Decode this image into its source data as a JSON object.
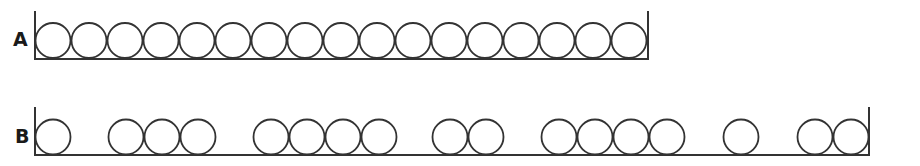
{
  "diagram": {
    "colors": {
      "stroke": "#333333",
      "background": "#ffffff"
    },
    "circle_diameter": 36,
    "rows": [
      {
        "label": "A",
        "circle_count": 17,
        "groups": [
          17
        ],
        "container": {
          "left_x": 35,
          "right_x": 648,
          "floor_y": 59,
          "wall_top_y": 11
        },
        "circle_cy": 40.5,
        "circle_starts_x": [
          35,
          71,
          107,
          143,
          179,
          215,
          251,
          287,
          323,
          359,
          395,
          431,
          467,
          503,
          539,
          575,
          611
        ]
      },
      {
        "label": "B",
        "circle_count": 17,
        "groups": [
          1,
          3,
          4,
          2,
          4,
          1,
          2
        ],
        "container": {
          "left_x": 35,
          "right_x": 869,
          "floor_y": 155,
          "wall_top_y": 107
        },
        "circle_cy": 137,
        "circle_starts_x": [
          35,
          108,
          144,
          180,
          253,
          289,
          325,
          361,
          432,
          468,
          541,
          577,
          613,
          649,
          723,
          797,
          833
        ]
      }
    ]
  }
}
